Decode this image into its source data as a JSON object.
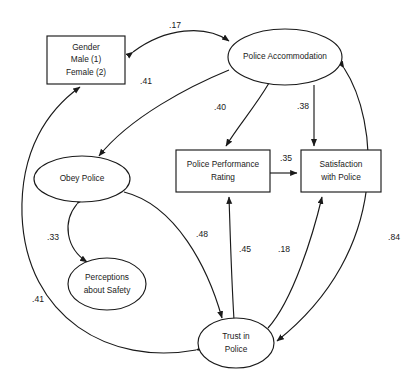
{
  "diagram": {
    "type": "path-diagram",
    "title": "",
    "nodes": [
      {
        "id": "gender",
        "shape": "rectangle",
        "lines": [
          "Gender",
          "Male (1)",
          "Female (2)"
        ],
        "x": 47,
        "y": 36,
        "w": 78,
        "h": 48
      },
      {
        "id": "police_accommodation",
        "shape": "ellipse",
        "lines": [
          "Police Accommodation"
        ],
        "cx": 285,
        "cy": 57,
        "rx": 57,
        "ry": 28
      },
      {
        "id": "obey_police",
        "shape": "ellipse",
        "lines": [
          "Obey Police"
        ],
        "cx": 82,
        "cy": 179,
        "rx": 48,
        "ry": 23
      },
      {
        "id": "police_performance_rating",
        "shape": "rectangle",
        "lines": [
          "Police Performance",
          "Rating"
        ],
        "x": 176,
        "y": 150,
        "w": 94,
        "h": 42
      },
      {
        "id": "satisfaction_with_police",
        "shape": "rectangle",
        "lines": [
          "Satisfaction",
          "with Police"
        ],
        "x": 301,
        "y": 150,
        "w": 80,
        "h": 42
      },
      {
        "id": "perceptions_about_safety",
        "shape": "ellipse",
        "lines": [
          "Perceptions",
          "about Safety"
        ],
        "cx": 107,
        "cy": 284,
        "rx": 39,
        "ry": 26
      },
      {
        "id": "trust_in_police",
        "shape": "ellipse",
        "lines": [
          "Trust in",
          "Police"
        ],
        "cx": 236,
        "cy": 343,
        "rx": 38,
        "ry": 25
      }
    ],
    "edges": [
      {
        "id": "e-accom-gender",
        "from": "police_accommodation",
        "to": "gender",
        "coefficient": ".17",
        "arrow": "double",
        "label_x": 175,
        "label_y": 26
      },
      {
        "id": "e-accom-obey",
        "from": "police_accommodation",
        "to": "obey_police",
        "coefficient": ".41",
        "arrow": "single",
        "label_x": 146,
        "label_y": 82
      },
      {
        "id": "e-accom-performance",
        "from": "police_accommodation",
        "to": "police_performance_rating",
        "coefficient": ".40",
        "arrow": "single",
        "label_x": 220,
        "label_y": 108
      },
      {
        "id": "e-accom-satisfaction",
        "from": "police_accommodation",
        "to": "satisfaction_with_police",
        "coefficient": ".38",
        "arrow": "single",
        "label_x": 303,
        "label_y": 107
      },
      {
        "id": "e-performance-satisfaction",
        "from": "police_performance_rating",
        "to": "satisfaction_with_police",
        "coefficient": ".35",
        "arrow": "single",
        "label_x": 286,
        "label_y": 159
      },
      {
        "id": "e-obey-perceptions",
        "from": "obey_police",
        "to": "perceptions_about_safety",
        "coefficient": ".33",
        "arrow": "double",
        "label_x": 53,
        "label_y": 238
      },
      {
        "id": "e-obey-trust",
        "from": "obey_police",
        "to": "trust_in_police",
        "coefficient": ".48",
        "arrow": "single",
        "label_x": 202,
        "label_y": 235
      },
      {
        "id": "e-trust-performance",
        "from": "trust_in_police",
        "to": "police_performance_rating",
        "coefficient": ".45",
        "arrow": "single",
        "label_x": 245,
        "label_y": 250
      },
      {
        "id": "e-trust-satisfaction",
        "from": "trust_in_police",
        "to": "satisfaction_with_police",
        "coefficient": ".18",
        "arrow": "single",
        "label_x": 284,
        "label_y": 250
      },
      {
        "id": "e-accom-trust",
        "from": "police_accommodation",
        "to": "trust_in_police",
        "coefficient": ".84",
        "arrow": "double",
        "label_x": 394,
        "label_y": 238
      },
      {
        "id": "e-trust-gender",
        "from": "trust_in_police",
        "to": "gender",
        "coefficient": ".41",
        "arrow": "double",
        "label_x": 38,
        "label_y": 300
      }
    ],
    "colors": {
      "stroke": "#1a1a1a",
      "fill": "#ffffff",
      "background": "#ffffff",
      "text": "#1a1a1a"
    }
  }
}
